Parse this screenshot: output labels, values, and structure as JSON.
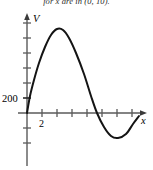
{
  "figure": {
    "caption_fragment": "for x are in (0, 10).",
    "background_color": "#ffffff",
    "ink_color": "#000000",
    "curve_color": "#1a1a1a",
    "axis_color": "#5a5a5a"
  },
  "axes": {
    "y_axis_label": "V",
    "x_axis_label": "x",
    "origin_px": {
      "x": 27,
      "y": 113
    },
    "x_axis": {
      "start_px": 18,
      "end_px": 147,
      "arrow": true,
      "tick_spacing_px": 15,
      "tick_positions_px": [
        42,
        57,
        72,
        87,
        102,
        117,
        132
      ],
      "labeled_ticks": [
        {
          "value": "2",
          "x_px": 42
        }
      ]
    },
    "y_axis": {
      "top_px": 14,
      "bottom_px": 166,
      "arrow": true,
      "tick_spacing_px": 15,
      "tick_positions_px": [
        23,
        38,
        53,
        68,
        83,
        98,
        128,
        143
      ],
      "labeled_ticks": [
        {
          "value": "200",
          "y_px": 98
        }
      ]
    }
  },
  "chart_data": {
    "type": "line",
    "title": "",
    "xlabel": "x",
    "ylabel": "V",
    "grid": false,
    "legend": null,
    "axis_arrows": true,
    "y_tick_labels": [
      "200"
    ],
    "x_tick_labels": [
      "2"
    ],
    "xlim": [
      0,
      10
    ],
    "ylim": [
      -400,
      1400
    ],
    "features": {
      "starts_at_origin": true,
      "local_maximum": {
        "x_px": 57,
        "y_px": 29
      },
      "x_intercept_descending": {
        "x_px": 97,
        "y_px": 113
      },
      "local_minimum": {
        "x_px": 118,
        "y_px": 138
      },
      "right_end": {
        "x_px": 139,
        "y_px": 116
      }
    },
    "path_points_px": [
      {
        "x": 27,
        "y": 113
      },
      {
        "x": 30,
        "y": 96
      },
      {
        "x": 34,
        "y": 80
      },
      {
        "x": 39,
        "y": 63
      },
      {
        "x": 45,
        "y": 47
      },
      {
        "x": 51,
        "y": 35
      },
      {
        "x": 57,
        "y": 29
      },
      {
        "x": 63,
        "y": 30
      },
      {
        "x": 69,
        "y": 38
      },
      {
        "x": 76,
        "y": 53
      },
      {
        "x": 84,
        "y": 74
      },
      {
        "x": 91,
        "y": 96
      },
      {
        "x": 97,
        "y": 113
      },
      {
        "x": 104,
        "y": 127
      },
      {
        "x": 111,
        "y": 136
      },
      {
        "x": 118,
        "y": 138
      },
      {
        "x": 126,
        "y": 134
      },
      {
        "x": 133,
        "y": 124
      },
      {
        "x": 139,
        "y": 116
      }
    ]
  }
}
